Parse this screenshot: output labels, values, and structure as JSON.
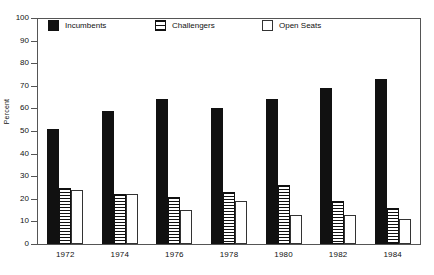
{
  "chart_data": {
    "type": "bar",
    "title": "",
    "xlabel": "",
    "ylabel": "Percent",
    "ylim": [
      0,
      100
    ],
    "yticks": [
      0,
      10,
      20,
      30,
      40,
      50,
      60,
      70,
      80,
      90,
      100
    ],
    "grid": false,
    "legend_position": "top-inside",
    "categories": [
      "1972",
      "1974",
      "1976",
      "1978",
      "1980",
      "1982",
      "1984"
    ],
    "series": [
      {
        "name": "Incumbents",
        "values": [
          51,
          59,
          64,
          60,
          64,
          69,
          73
        ]
      },
      {
        "name": "Challengers",
        "values": [
          25,
          22,
          21,
          23,
          26,
          19,
          16
        ]
      },
      {
        "name": "Open Seats",
        "values": [
          24,
          22,
          15,
          19,
          13,
          13,
          11
        ]
      }
    ]
  },
  "axes": {
    "y_title": "Percent",
    "y_labels": [
      "100",
      "90",
      "80",
      "70",
      "60",
      "50",
      "40",
      "30",
      "20",
      "10",
      "0"
    ],
    "x_labels": [
      "1972",
      "1974",
      "1976",
      "1978",
      "1980",
      "1982",
      "1984"
    ]
  },
  "legend": {
    "items": [
      {
        "label": "Incumbents",
        "pattern": "solid-black-swatch"
      },
      {
        "label": "Challengers",
        "pattern": "horizontal-stripe-swatch"
      },
      {
        "label": "Open Seats",
        "pattern": "empty-outline-swatch"
      }
    ]
  },
  "colors": {
    "incumbents": "#111111",
    "challengers_stripe": "#111111",
    "open_seats_fill": "#ffffff",
    "axis": "#555555",
    "text": "#111111",
    "background": "#ffffff"
  }
}
